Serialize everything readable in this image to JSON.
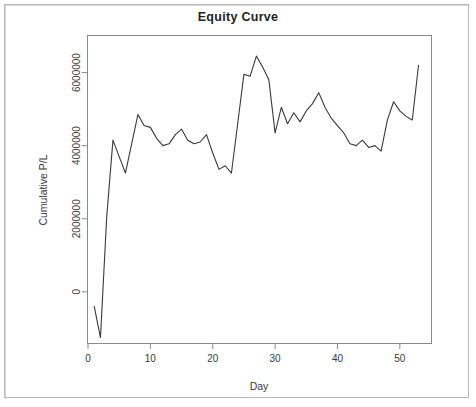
{
  "figure": {
    "title": "Equity Curve",
    "background_color": "#ffffff",
    "line_color": "#3a3a3a",
    "axis_color": "#8a8a8a",
    "frame_color": "#b9b9b9"
  },
  "chart_data": {
    "type": "line",
    "title": "Equity Curve",
    "xlabel": "Day",
    "ylabel": "Cumulative P/L",
    "xlim": [
      0,
      55
    ],
    "ylim": [
      -1400000,
      7000000
    ],
    "grid": false,
    "legend": null,
    "xticks": [
      0,
      10,
      20,
      30,
      40,
      50
    ],
    "xtick_labels": [
      "0",
      "10",
      "20",
      "30",
      "40",
      "50"
    ],
    "yticks": [
      0,
      2000000,
      4000000,
      6000000
    ],
    "ytick_labels": [
      "0",
      "2000000",
      "4000000",
      "6000000"
    ],
    "series": [
      {
        "name": "Cumulative P/L",
        "x": [
          1,
          2,
          3,
          4,
          5,
          6,
          7,
          8,
          9,
          10,
          11,
          12,
          13,
          14,
          15,
          16,
          17,
          18,
          19,
          20,
          21,
          22,
          23,
          24,
          25,
          26,
          27,
          28,
          29,
          30,
          31,
          32,
          33,
          34,
          35,
          36,
          37,
          38,
          39,
          40,
          41,
          42,
          43,
          44,
          45,
          46,
          47,
          48,
          49,
          50,
          51,
          52,
          53
        ],
        "values": [
          -400000,
          -1250000,
          2050000,
          4150000,
          3700000,
          3250000,
          4050000,
          4850000,
          4550000,
          4500000,
          4200000,
          4000000,
          4050000,
          4300000,
          4450000,
          4150000,
          4050000,
          4100000,
          4300000,
          3800000,
          3350000,
          3450000,
          3250000,
          4600000,
          5950000,
          5900000,
          6450000,
          6150000,
          5800000,
          4350000,
          5050000,
          4600000,
          4900000,
          4650000,
          4950000,
          5150000,
          5450000,
          5050000,
          4750000,
          4550000,
          4350000,
          4050000,
          4000000,
          4150000,
          3950000,
          4000000,
          3850000,
          4700000,
          5200000,
          4950000,
          4800000,
          4700000,
          6200000
        ]
      }
    ]
  }
}
